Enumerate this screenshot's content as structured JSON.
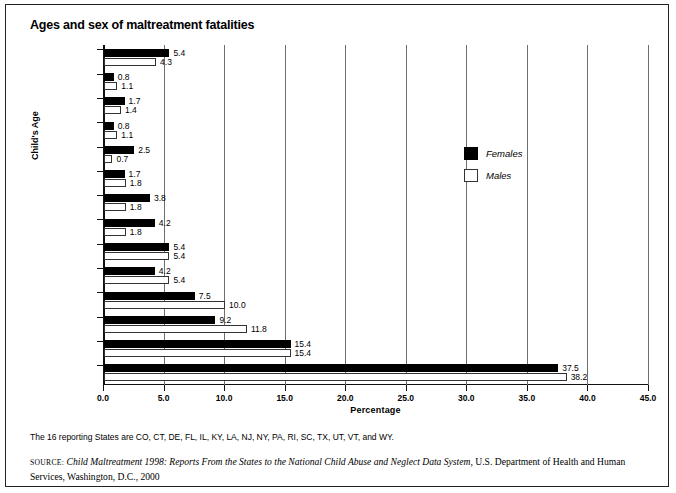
{
  "chart_data": {
    "type": "bar",
    "orientation": "horizontal",
    "title": "Ages and sex of maltreatment fatalities",
    "xlabel": "Percentage",
    "ylabel": "Child's Age",
    "xlim": [
      0.0,
      45.0
    ],
    "xticks": [
      "0.0",
      "5.0",
      "10.0",
      "15.0",
      "20.0",
      "25.0",
      "30.0",
      "35.0",
      "40.0",
      "45.0"
    ],
    "xtick_values": [
      0,
      5,
      10,
      15,
      20,
      25,
      30,
      35,
      40,
      45
    ],
    "grid": "vertical",
    "legend_position": "inside-right",
    "categories": [
      "13 and Older",
      "12",
      "11",
      "10",
      "9",
      "8",
      "7",
      "6",
      "5",
      "4",
      "3",
      "2",
      "1",
      "<1"
    ],
    "series": [
      {
        "name": "Females",
        "color": "#000000",
        "values": [
          5.4,
          0.8,
          1.7,
          0.8,
          2.5,
          1.7,
          3.8,
          4.2,
          5.4,
          4.2,
          7.5,
          9.2,
          15.4,
          37.5
        ],
        "labels": [
          "5.4",
          "0.8",
          "1.7",
          "0.8",
          "2.5",
          "1.7",
          "3.8",
          "4.2",
          "5.4",
          "4.2",
          "7.5",
          "9.2",
          "15.4",
          "37.5"
        ]
      },
      {
        "name": "Males",
        "color": "#ffffff",
        "values": [
          4.3,
          1.1,
          1.4,
          1.1,
          0.7,
          1.8,
          1.8,
          1.8,
          5.4,
          5.4,
          10.0,
          11.8,
          15.4,
          38.2
        ],
        "labels": [
          "4.3",
          "1.1",
          "1.4",
          "1.1",
          "0.7",
          "1.8",
          "1.8",
          "1.8",
          "5.4",
          "5.4",
          "10.0",
          "11.8",
          "15.4",
          "38.2"
        ]
      }
    ]
  },
  "notes": {
    "states_note": "The 16 reporting States are CO, CT, DE, FL, IL, KY, LA, NJ, NY, PA, RI, SC, TX, UT, VT, and WY.",
    "source_prefix": "Source:",
    "source_italic": "Child Maltreatment 1998: Reports From the States to the National Child Abuse and Neglect Data System",
    "source_rest": ", U.S. Department of Health and Human Services, Washington, D.C., 2000"
  }
}
